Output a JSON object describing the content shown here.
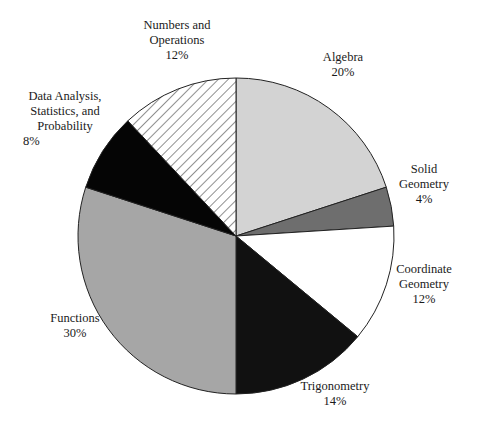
{
  "chart_data": {
    "type": "pie",
    "title": "",
    "start_angle_deg": 0,
    "direction": "clockwise",
    "slices": [
      {
        "label": "Algebra",
        "label_lines": [
          "Algebra"
        ],
        "value": 20,
        "pct_text": "20%",
        "fill": "#d3d3d3",
        "pattern": "solid"
      },
      {
        "label": "Solid Geometry",
        "label_lines": [
          "Solid",
          "Geometry"
        ],
        "value": 4,
        "pct_text": "4%",
        "fill": "#6e6e6e",
        "pattern": "solid"
      },
      {
        "label": "Coordinate Geometry",
        "label_lines": [
          "Coordinate",
          "Geometry"
        ],
        "value": 12,
        "pct_text": "12%",
        "fill": "#ffffff",
        "pattern": "solid"
      },
      {
        "label": "Trigonometry",
        "label_lines": [
          "Trigonometry"
        ],
        "value": 14,
        "pct_text": "14%",
        "fill": "#111111",
        "pattern": "solid"
      },
      {
        "label": "Functions",
        "label_lines": [
          "Functions"
        ],
        "value": 30,
        "pct_text": "30%",
        "fill": "#a6a6a6",
        "pattern": "solid"
      },
      {
        "label": "Data Analysis, Statistics, and Probability",
        "label_lines": [
          "Data Analysis,",
          "Statistics, and",
          "Probability"
        ],
        "value": 8,
        "pct_text": "8%",
        "fill": "#050505",
        "pattern": "solid"
      },
      {
        "label": "Numbers and Operations",
        "label_lines": [
          "Numbers and",
          "Operations"
        ],
        "value": 12,
        "pct_text": "12%",
        "fill": "#ffffff",
        "pattern": "diagonal-hatch"
      }
    ],
    "legend": "none (labels placed beside slices)"
  },
  "labels": {
    "algebra": {
      "l1": "Algebra",
      "pct": "20%"
    },
    "solid": {
      "l1": "Solid",
      "l2": "Geometry",
      "pct": "4%"
    },
    "coord": {
      "l1": "Coordinate",
      "l2": "Geometry",
      "pct": "12%"
    },
    "trig": {
      "l1": "Trigonometry",
      "pct": "14%"
    },
    "functions": {
      "l1": "Functions",
      "pct": "30%"
    },
    "data": {
      "l1": "Data Analysis,",
      "l2": "Statistics, and",
      "l3": "Probability",
      "pct": "8%"
    },
    "numbers": {
      "l1": "Numbers and",
      "l2": "Operations",
      "pct": "12%"
    }
  }
}
